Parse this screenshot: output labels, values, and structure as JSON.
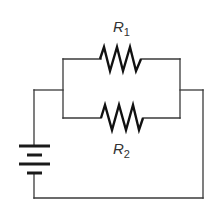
{
  "diagram": {
    "type": "circuit",
    "components": {
      "resistor_1": {
        "label": "R",
        "subscript": "1"
      },
      "resistor_2": {
        "label": "R",
        "subscript": "2"
      },
      "battery": {
        "cells": 2
      }
    },
    "colors": {
      "wire": "#3a3a3a",
      "component": "#111111",
      "label": "#333333",
      "background": "#ffffff"
    }
  }
}
